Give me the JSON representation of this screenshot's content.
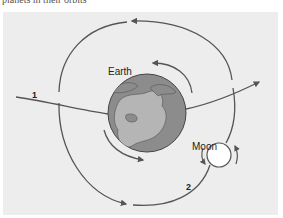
{
  "caption": "planets in their orbits",
  "diagram": {
    "labels": {
      "earth": "Earth",
      "moon": "Moon",
      "path1": "1",
      "path2": "2"
    },
    "colors": {
      "panel_bg": "#ededed",
      "line": "#555555",
      "earth_ocean": "#8c8c8c",
      "earth_land": "#b5b5b5",
      "moon": "#ffffff"
    }
  }
}
